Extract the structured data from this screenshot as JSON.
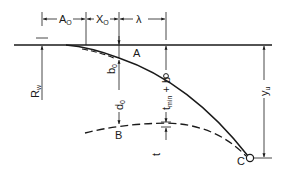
{
  "diagram": {
    "type": "geometry-cross-section",
    "colors": {
      "ink": "#1a1a1a",
      "background": "#ffffff"
    },
    "dimensions_top": [
      {
        "id": "A0",
        "label": "A",
        "sub": "O"
      },
      {
        "id": "X0",
        "label": "X",
        "sub": "O"
      },
      {
        "id": "lambda",
        "label": "λ",
        "sub": ""
      }
    ],
    "points": [
      {
        "id": "A",
        "label": "A"
      },
      {
        "id": "B",
        "label": "B"
      },
      {
        "id": "C",
        "label": "C"
      }
    ],
    "vertical_labels": {
      "rw": {
        "label": "R",
        "sub": "w"
      },
      "b0": {
        "label": "b",
        "sub": "0"
      },
      "d0": {
        "label": "d",
        "sub": "0"
      },
      "tmin_b": {
        "label": "t",
        "sub": "min",
        "suffix": " + b"
      },
      "t": {
        "label": "t",
        "sub": ""
      },
      "yu": {
        "label": "y",
        "sub": "u"
      }
    },
    "curves": [
      {
        "id": "upper-profile",
        "style": "solid",
        "from": "tangent-point",
        "through": "A",
        "to": "C"
      },
      {
        "id": "upper-profile-offset",
        "style": "dashed",
        "from": "tangent-point",
        "to": "A"
      },
      {
        "id": "lower-profile",
        "style": "dashed",
        "through": "B",
        "to": "C"
      }
    ]
  }
}
